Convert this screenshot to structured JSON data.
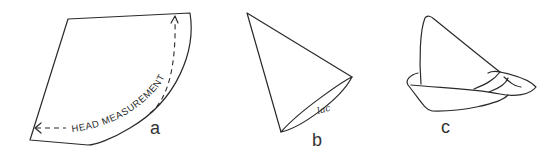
{
  "figure": {
    "panels": [
      {
        "id": "a",
        "label": "a",
        "shape": "fan-shaped pattern piece (circular sector)",
        "annotation": "HEAD MEASUREMENT",
        "annotation_style": "dashed double-headed arrow along curved edge"
      },
      {
        "id": "b",
        "label": "b",
        "shape": "cone formed from pattern",
        "annotation": "lac",
        "annotation_style": "small handwritten note at seam"
      },
      {
        "id": "c",
        "label": "c",
        "shape": "finished hat with upturned brim and band"
      }
    ]
  }
}
